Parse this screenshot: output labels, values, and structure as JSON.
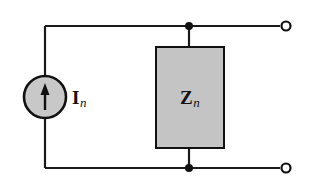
{
  "diagram": {
    "type": "circuit-schematic",
    "colors": {
      "stroke": "#111111",
      "fill_gray": "#c4c4c4",
      "background": "#ffffff"
    },
    "components": {
      "current_source": {
        "symbol": "I",
        "subscript": "n",
        "direction": "up"
      },
      "impedance": {
        "symbol": "Z",
        "subscript": "n"
      },
      "terminals": [
        {
          "position": "top"
        },
        {
          "position": "bottom"
        }
      ],
      "junctions": [
        {
          "position": "top"
        },
        {
          "position": "bottom"
        }
      ]
    }
  }
}
